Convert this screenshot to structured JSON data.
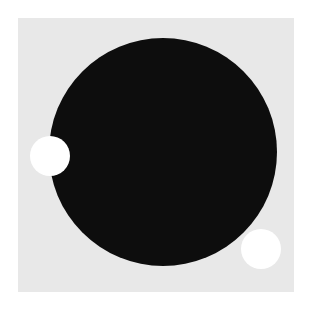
{
  "figure": {
    "background": "#ffffff",
    "panel": {
      "x": 18,
      "y": 18,
      "width": 276,
      "height": 274,
      "color": "#e8e8e8"
    },
    "shapes": [
      {
        "name": "large-black-circle",
        "cx": 163,
        "cy": 152,
        "r": 114,
        "color": "#0d0d0d"
      },
      {
        "name": "small-white-circle-left",
        "cx": 50,
        "cy": 156,
        "r": 20,
        "color": "#ffffff"
      },
      {
        "name": "small-white-circle-bottom-right",
        "cx": 261,
        "cy": 249,
        "r": 20,
        "color": "#ffffff"
      }
    ]
  }
}
